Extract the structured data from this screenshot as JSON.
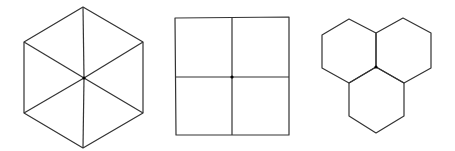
{
  "canvas": {
    "width": 455,
    "height": 151,
    "background": "#ffffff"
  },
  "colors": {
    "stroke": "#333333",
    "vertex_dot": "#000000"
  },
  "figures": [
    {
      "name": "hexagon-divided-into-six-triangles",
      "outline": "83,7 143,42 143,113 83,148 24,113 24,42",
      "center": {
        "x": 84,
        "y": 78
      },
      "spokes": [
        "84,78 83,7",
        "84,78 143,42",
        "84,78 143,113",
        "84,78 83,148",
        "84,78 24,113",
        "84,78 24,42"
      ]
    },
    {
      "name": "square-divided-into-four-squares",
      "outline": "175,18 289,17 289,135 176,135",
      "center": {
        "x": 232,
        "y": 77
      },
      "dividers": [
        "232,17 232,135",
        "175,77 289,77"
      ]
    },
    {
      "name": "three-hexagons-meeting-at-point",
      "hexagons": [
        "349,19 376,33 376,67 349,83 322,68 322,35",
        "403,18 431,33 431,68 404,83 376,67 376,33",
        "376,67 404,83 404,116 376,133 349,116 349,83"
      ],
      "center": {
        "x": 376,
        "y": 67
      }
    }
  ]
}
